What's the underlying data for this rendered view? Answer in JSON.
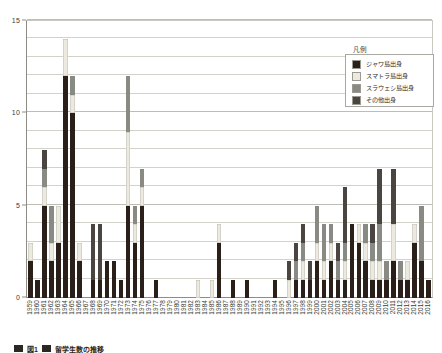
{
  "chart_data": {
    "type": "bar",
    "subtype": "stacked-vertical",
    "title": "",
    "xlabel": "",
    "ylabel": "",
    "ylim": [
      0,
      15
    ],
    "yticks": [
      0,
      5,
      10,
      15
    ],
    "ytick_labels": [
      "0",
      "5",
      "10",
      "15"
    ],
    "grid": "horizontal-every-1",
    "gridline_values": [
      1,
      2,
      3,
      4,
      6,
      7,
      8,
      9,
      11,
      12,
      13,
      14
    ],
    "legend_position": "top-right-inside",
    "legend_title": "凡例",
    "series": [
      {
        "name": "ジャワ島出身",
        "color": "#2a2019",
        "values": [
          2,
          1,
          5,
          2,
          3,
          12,
          10,
          2,
          0,
          1,
          1,
          2,
          2,
          1,
          5,
          3,
          5,
          0,
          1,
          0,
          0,
          0,
          0,
          0,
          0,
          0,
          0,
          3,
          0,
          1,
          0,
          1,
          0,
          0,
          0,
          1,
          0,
          0,
          1,
          1,
          1,
          2,
          1,
          2,
          1,
          1,
          4,
          3,
          2,
          1,
          1,
          1,
          2,
          1,
          1,
          3,
          2,
          1
        ]
      },
      {
        "name": "スマトラ島出身",
        "color": "#ece9df",
        "values": [
          1,
          0,
          1,
          1,
          2,
          2,
          1,
          1,
          0,
          0,
          0,
          0,
          0,
          0,
          4,
          1,
          1,
          0,
          0,
          0,
          0,
          0,
          0,
          0,
          1,
          0,
          1,
          1,
          0,
          0,
          0,
          0,
          0,
          0,
          0,
          0,
          0,
          1,
          0,
          1,
          0,
          1,
          1,
          1,
          0,
          1,
          0,
          1,
          1,
          1,
          1,
          0,
          2,
          0,
          1,
          1,
          0,
          0
        ]
      },
      {
        "name": "スラウェシ島出身",
        "color": "#8a8a84",
        "values": [
          0,
          0,
          1,
          2,
          0,
          0,
          1,
          0,
          0,
          0,
          0,
          0,
          0,
          0,
          3,
          1,
          1,
          0,
          0,
          0,
          0,
          0,
          0,
          0,
          0,
          0,
          0,
          0,
          0,
          0,
          0,
          0,
          0,
          0,
          0,
          0,
          0,
          0,
          1,
          1,
          0,
          2,
          2,
          1,
          1,
          1,
          0,
          0,
          1,
          1,
          2,
          1,
          0,
          1,
          0,
          0,
          3,
          0
        ]
      },
      {
        "name": "その他出身",
        "color": "#4a4540",
        "values": [
          0,
          0,
          1,
          0,
          0,
          0,
          0,
          0,
          0,
          3,
          3,
          0,
          0,
          0,
          0,
          0,
          0,
          0,
          0,
          0,
          0,
          0,
          0,
          0,
          0,
          0,
          0,
          0,
          0,
          0,
          0,
          0,
          0,
          0,
          0,
          0,
          0,
          1,
          1,
          1,
          1,
          0,
          0,
          0,
          1,
          3,
          0,
          0,
          0,
          1,
          3,
          0,
          3,
          0,
          0,
          0,
          0,
          0
        ]
      }
    ],
    "categories": [
      "1959",
      "1960",
      "1961",
      "1962",
      "1963",
      "1964",
      "1965",
      "1966",
      "1967",
      "1968",
      "1969",
      "1970",
      "1971",
      "1972",
      "1973",
      "1974",
      "1975",
      "1976",
      "1977",
      "1978",
      "1979",
      "1980",
      "1981",
      "1982",
      "1983",
      "1984",
      "1985",
      "1986",
      "1987",
      "1988",
      "1989",
      "1990",
      "1991",
      "1992",
      "1993",
      "1994",
      "1995",
      "1996",
      "1997",
      "1998",
      "1999",
      "2000",
      "2001",
      "2002",
      "2003",
      "2004",
      "2005",
      "2006",
      "2007",
      "2008",
      "2009",
      "2010",
      "2011",
      "2012",
      "2013",
      "2014",
      "2015",
      "2016"
    ],
    "totals": [
      3,
      1,
      8,
      5,
      5,
      14,
      12,
      3,
      0,
      4,
      4,
      2,
      2,
      1,
      12,
      5,
      7,
      0,
      1,
      0,
      0,
      0,
      0,
      0,
      1,
      1,
      1,
      4,
      0,
      1,
      0,
      1,
      0,
      0,
      0,
      1,
      0,
      2,
      3,
      4,
      2,
      5,
      4,
      4,
      3,
      6,
      4,
      4,
      4,
      4,
      7,
      2,
      7,
      2,
      2,
      4,
      5,
      1
    ]
  },
  "legend": {
    "title": "凡例",
    "entries": [
      {
        "label": "ジャワ島出身",
        "color": "#2a2019"
      },
      {
        "label": "スマトラ島出身",
        "color": "#ece9df"
      },
      {
        "label": "スラウェシ島出身",
        "color": "#8a8a84"
      },
      {
        "label": "その他出身",
        "color": "#4a4540"
      }
    ]
  },
  "caption": {
    "figure_label": "図1",
    "title": "留学生数の推移",
    "subtitle": ""
  },
  "colors": {
    "axis": "#8d8d86",
    "grid": "#d2d2cb",
    "text": "#3b3b36",
    "background": "#ffffff"
  }
}
